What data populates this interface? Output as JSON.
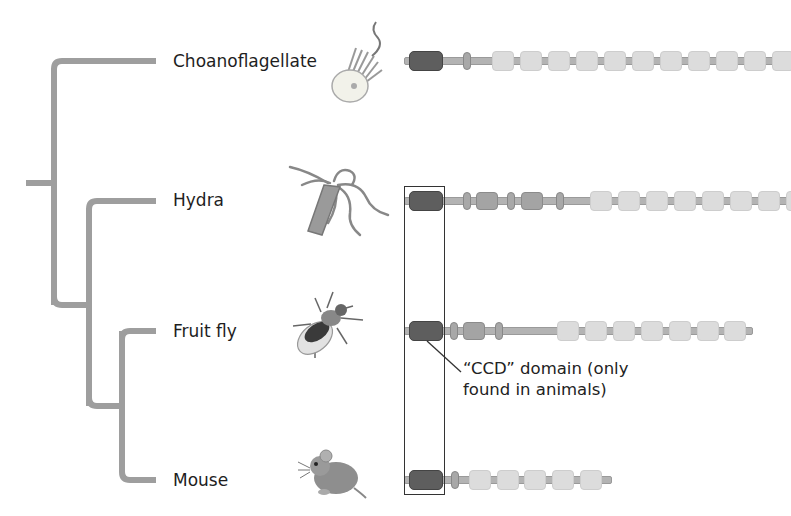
{
  "figure": {
    "type": "phylogenetic-tree-with-protein-domain-diagrams",
    "colors": {
      "tree_branch": "#9e9e9e",
      "ccd_domain": "#5e5e5e",
      "medium_domain": "#a4a4a4",
      "light_domain": "#dcdcdc",
      "protein_backbone": "#b3b3b3",
      "highlight_box": "#333333"
    }
  },
  "taxa": [
    {
      "name": "Choanoflagellate",
      "organism_icon": "choanoflagellate-illustration",
      "protein": {
        "domains": [
          "ccd",
          "oval",
          "light",
          "light",
          "light",
          "light",
          "light",
          "light",
          "light",
          "light",
          "light",
          "light",
          "light",
          "light"
        ],
        "extends_off_edge": true
      }
    },
    {
      "name": "Hydra",
      "organism_icon": "hydra-illustration",
      "protein": {
        "domains": [
          "ccd",
          "oval",
          "medium",
          "oval",
          "medium",
          "oval",
          "light",
          "light",
          "light",
          "light",
          "light",
          "light",
          "light",
          "light"
        ],
        "extends_off_edge": true
      }
    },
    {
      "name": "Fruit fly",
      "organism_icon": "fruit-fly-illustration",
      "protein": {
        "domains": [
          "ccd",
          "oval",
          "medium",
          "oval",
          "light",
          "light",
          "light",
          "light",
          "light",
          "light",
          "light"
        ],
        "extends_off_edge": false
      }
    },
    {
      "name": "Mouse",
      "organism_icon": "mouse-illustration",
      "protein": {
        "domains": [
          "ccd",
          "oval",
          "light",
          "light",
          "light",
          "light",
          "light"
        ],
        "extends_off_edge": false
      }
    }
  ],
  "annotation": {
    "line1": "“CCD” domain (only",
    "line2": "found in animals)"
  }
}
